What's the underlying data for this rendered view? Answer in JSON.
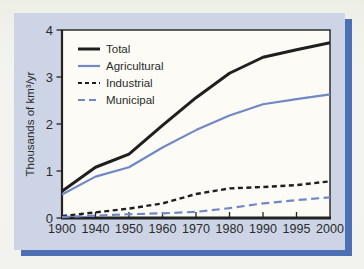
{
  "window": {
    "width": 364,
    "height": 269
  },
  "figure": {
    "panel_bg": "#ccd4e6",
    "shadow_color": "#4d70b4",
    "plot_bg": "#fcfbf6",
    "axis_color": "#222222",
    "text_color": "#2b2b2b"
  },
  "chart_data": {
    "type": "line",
    "title": "",
    "xlabel": "",
    "ylabel": "Thousands of km³/yr",
    "ylim": [
      0,
      4
    ],
    "y_ticks": [
      "0",
      "1",
      "2",
      "3",
      "4"
    ],
    "categories": [
      "1900",
      "1940",
      "1950",
      "1960",
      "1970",
      "1980",
      "1990",
      "1995",
      "2000"
    ],
    "x_spacing": "categorical-even",
    "grid": false,
    "legend_position": "inside-top-left",
    "series": [
      {
        "name": "Total",
        "color": "#1f1f1f",
        "line_style": "solid",
        "values": [
          0.57,
          1.08,
          1.36,
          1.97,
          2.56,
          3.08,
          3.42,
          3.58,
          3.73
        ]
      },
      {
        "name": "Agricultural",
        "color": "#7288c5",
        "line_style": "solid",
        "values": [
          0.5,
          0.88,
          1.08,
          1.5,
          1.87,
          2.18,
          2.42,
          2.53,
          2.63
        ]
      },
      {
        "name": "Industrial",
        "color": "#1f1f1f",
        "line_style": "dashed",
        "values": [
          0.04,
          0.12,
          0.2,
          0.31,
          0.51,
          0.63,
          0.66,
          0.7,
          0.78
        ]
      },
      {
        "name": "Municipal",
        "color": "#7288c5",
        "line_style": "dashed",
        "values": [
          0.02,
          0.05,
          0.08,
          0.1,
          0.13,
          0.21,
          0.31,
          0.38,
          0.44
        ]
      }
    ]
  }
}
